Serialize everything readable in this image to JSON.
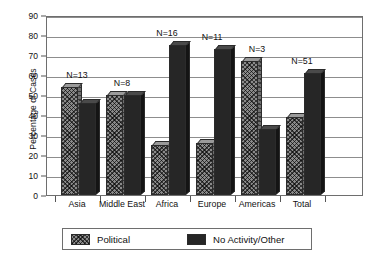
{
  "chart_data": {
    "type": "bar",
    "title": "",
    "xlabel": "",
    "ylabel": "Percentage of Cases",
    "ylim": [
      0,
      90
    ],
    "ytick_step": 10,
    "yticks": [
      "0",
      "10",
      "20",
      "30",
      "40",
      "50",
      "60",
      "70",
      "80",
      "90"
    ],
    "grid": true,
    "legend_position": "bottom",
    "categories": [
      "Asia",
      "Middle East",
      "Africa",
      "Europe",
      "Americas",
      "Total"
    ],
    "group_annotations": [
      "N=13",
      "N=8",
      "N=16",
      "N=11",
      "N=3",
      "N=51"
    ],
    "series": [
      {
        "name": "Political",
        "color": "#8a8a8a",
        "pattern": "crosshatch",
        "values": [
          54,
          50,
          25,
          26,
          67,
          39
        ]
      },
      {
        "name": "No Activity/Other",
        "color": "#262626",
        "pattern": "solid",
        "values": [
          46,
          50,
          75,
          73,
          33,
          61
        ]
      }
    ]
  },
  "legend": {
    "items": [
      {
        "label": "Political",
        "swatch": "political"
      },
      {
        "label": "No Activity/Other",
        "swatch": "noactivity"
      }
    ]
  },
  "axes": {
    "y_title": "Percentage of Cases"
  }
}
